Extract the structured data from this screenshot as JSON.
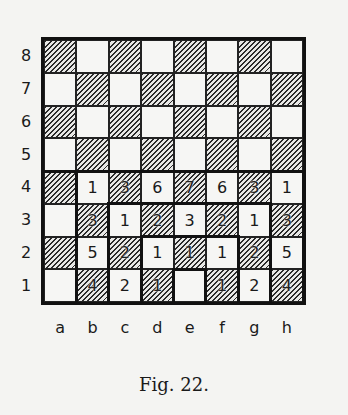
{
  "figure": {
    "caption": "Fig. 22.",
    "files": [
      "a",
      "b",
      "c",
      "d",
      "e",
      "f",
      "g",
      "h"
    ],
    "ranks": [
      "8",
      "7",
      "6",
      "5",
      "4",
      "3",
      "2",
      "1"
    ],
    "square_shading": {
      "dark": "hatched",
      "light": "white"
    },
    "numbers": {
      "4": {
        "b": "1",
        "c": "3",
        "d": "6",
        "e": "7",
        "f": "6",
        "g": "3",
        "h": "1"
      },
      "3": {
        "b": "3",
        "c": "1",
        "d": "2",
        "e": "3",
        "f": "2",
        "g": "1",
        "h": "3"
      },
      "2": {
        "b": "5",
        "c": "2",
        "d": "1",
        "e": "1",
        "f": "1",
        "g": "2",
        "h": "5"
      },
      "1": {
        "b": "4",
        "c": "2",
        "d": "1",
        "f": "1",
        "g": "2",
        "h": "4"
      }
    },
    "thick_regions": [
      "divider below rank 5",
      "rectangle b1-h4",
      "rectangle c1-g3",
      "rectangle d1-f2",
      "square e1"
    ]
  }
}
